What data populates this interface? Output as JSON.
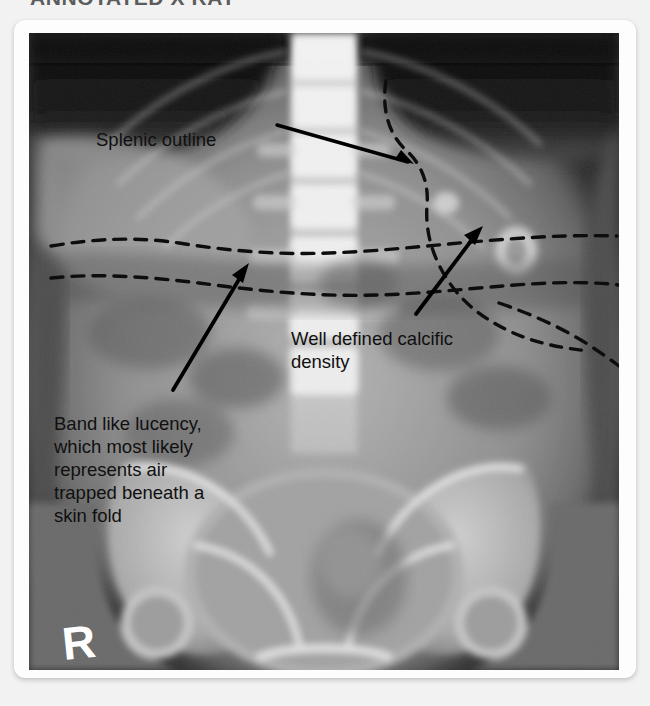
{
  "page": {
    "background_color": "#f2f2f2",
    "heading": "ANNOTATED X RAY"
  },
  "card": {
    "background_color": "#fdfdfd"
  },
  "radiograph": {
    "type": "abdominal-pelvic-plain-film",
    "modality_label": "X-ray",
    "side_marker": "R",
    "marker_color": "#ffffff",
    "background_color": "#0a0a0a"
  },
  "annotations": {
    "text_color": "#101010",
    "line_color": "#000000",
    "items": [
      {
        "id": "splenic-outline",
        "label": "Splenic outline",
        "arrow_from": [
          277,
          125
        ],
        "arrow_to": [
          412,
          164
        ]
      },
      {
        "id": "calcific-density",
        "label": "Well defined calcific\ndensity",
        "arrow_from": [
          416,
          313
        ],
        "arrow_to": [
          486,
          225
        ]
      },
      {
        "id": "band-like-lucency",
        "label": "Band like lucency,\nwhich most likely\nrepresents air\ntrapped beneath a\nskin fold",
        "arrow_from": [
          173,
          389
        ],
        "arrow_to": [
          249,
          264
        ]
      }
    ],
    "dashed_overlays": [
      {
        "id": "splenic-contour",
        "style": "curved-dashed"
      },
      {
        "id": "lucency-band-upper",
        "style": "wavy-dashed-horizontal"
      },
      {
        "id": "lucency-band-lower",
        "style": "wavy-dashed-horizontal"
      }
    ]
  }
}
